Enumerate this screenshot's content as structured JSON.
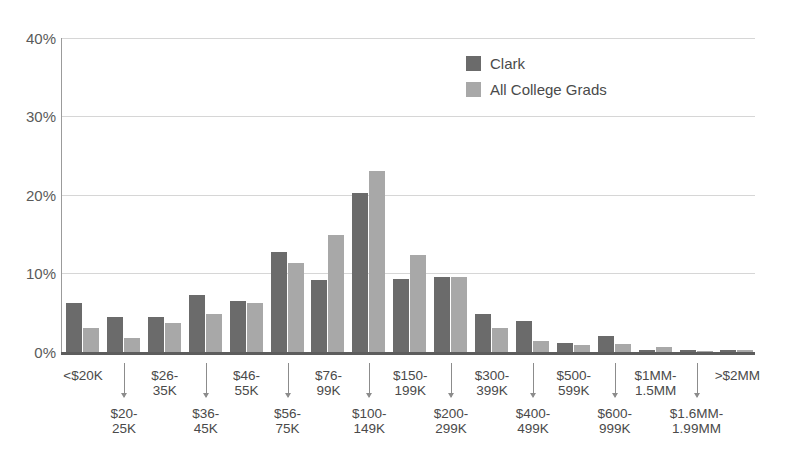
{
  "chart_data": {
    "type": "bar",
    "title": "",
    "xlabel": "",
    "ylabel": "",
    "ylim": [
      0,
      40
    ],
    "yticks": [
      "0%",
      "10%",
      "20%",
      "30%",
      "40%"
    ],
    "ytick_values": [
      0,
      10,
      20,
      30,
      40
    ],
    "grid": true,
    "legend_position": "top-center",
    "categories": [
      "<$20K",
      "$20-25K",
      "$26-35K",
      "$36-45K",
      "$46-55K",
      "$56-75K",
      "$76-99K",
      "$100-149K",
      "$150-199K",
      "$200-299K",
      "$300-399K",
      "$400-499K",
      "$500-599K",
      "$600-999K",
      "$1MM-1.5MM",
      "$1.6MM-1.99MM",
      ">$2MM"
    ],
    "category_labels_top": [
      "<$20K",
      "$26-\n35K",
      "$46-\n55K",
      "$76-\n99K",
      "$150-\n199K",
      "$300-\n399K",
      "$500-\n599K",
      "$1MM-\n1.5MM",
      ">$2MM"
    ],
    "category_labels_bottom": [
      "$20-\n25K",
      "$36-\n45K",
      "$56-\n75K",
      "$100-\n149K",
      "$200-\n299K",
      "$400-\n499K",
      "$600-\n999K",
      "$1.6MM-\n1.99MM"
    ],
    "series": [
      {
        "name": "Clark",
        "color": "#6b6b6b",
        "values": [
          6.3,
          4.4,
          4.4,
          7.2,
          6.5,
          12.8,
          9.2,
          20.2,
          9.3,
          9.5,
          4.8,
          3.9,
          1.1,
          2.0,
          0.2,
          0.2,
          0.3
        ]
      },
      {
        "name": "All College Grads",
        "color": "#a8a8a8",
        "values": [
          3.0,
          1.8,
          3.7,
          4.9,
          6.2,
          11.3,
          14.9,
          23.1,
          12.4,
          9.5,
          3.0,
          1.4,
          0.9,
          1.0,
          0.6,
          0.1,
          0.3
        ]
      }
    ]
  },
  "legend": {
    "items": [
      {
        "label": "Clark",
        "color": "#6b6b6b"
      },
      {
        "label": "All College Grads",
        "color": "#a8a8a8"
      }
    ]
  },
  "axis": {
    "y_tick_0": "0%",
    "y_tick_1": "10%",
    "y_tick_2": "20%",
    "y_tick_3": "30%",
    "y_tick_4": "40%"
  },
  "xaxis": {
    "top_row": [
      {
        "line1": "<$20K",
        "line2": ""
      },
      {
        "line1": "$26-",
        "line2": "35K"
      },
      {
        "line1": "$46-",
        "line2": "55K"
      },
      {
        "line1": "$76-",
        "line2": "99K"
      },
      {
        "line1": "$150-",
        "line2": "199K"
      },
      {
        "line1": "$300-",
        "line2": "399K"
      },
      {
        "line1": "$500-",
        "line2": "599K"
      },
      {
        "line1": "$1MM-",
        "line2": "1.5MM"
      },
      {
        "line1": ">$2MM",
        "line2": ""
      }
    ],
    "bottom_row": [
      {
        "line1": "$20-",
        "line2": "25K"
      },
      {
        "line1": "$36-",
        "line2": "45K"
      },
      {
        "line1": "$56-",
        "line2": "75K"
      },
      {
        "line1": "$100-",
        "line2": "149K"
      },
      {
        "line1": "$200-",
        "line2": "299K"
      },
      {
        "line1": "$400-",
        "line2": "499K"
      },
      {
        "line1": "$600-",
        "line2": "999K"
      },
      {
        "line1": "$1.6MM-",
        "line2": "1.99MM"
      }
    ]
  },
  "colors": {
    "series_dark": "#6b6b6b",
    "series_light": "#a8a8a8",
    "gridline": "#d6d6d6",
    "axis": "#5d5d5d",
    "text": "#4a4a4a"
  }
}
